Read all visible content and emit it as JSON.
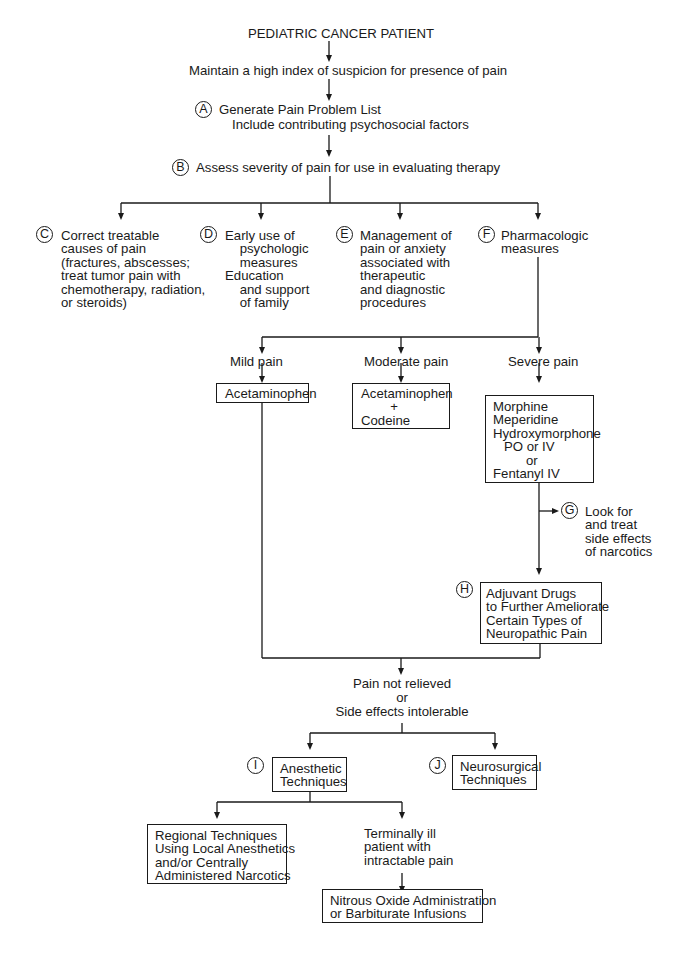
{
  "title": "PEDIATRIC CANCER PATIENT",
  "steps": {
    "suspicion": "Maintain a high index of suspicion for presence of pain",
    "A": {
      "badge": "A",
      "line1": "Generate Pain Problem List",
      "line2": "Include contributing psychosocial factors"
    },
    "B": {
      "badge": "B",
      "text": "Assess severity of pain for use in evaluating therapy"
    }
  },
  "branches": {
    "C": {
      "badge": "C",
      "text": "Correct treatable\ncauses of pain\n(fractures, abscesses;\ntreat tumor pain with\nchemotherapy, radiation,\nor steroids)"
    },
    "D": {
      "badge": "D",
      "text": "Early use of\n    psychologic\n    measures\nEducation\n    and support\n    of family"
    },
    "E": {
      "badge": "E",
      "text": "Management of\npain or anxiety\nassociated with\ntherapeutic\nand diagnostic\nprocedures"
    },
    "F": {
      "badge": "F",
      "text": "Pharmacologic\nmeasures"
    }
  },
  "pain_levels": {
    "mild": {
      "label": "Mild pain",
      "drug": "Acetaminophen"
    },
    "moderate": {
      "label": "Moderate pain",
      "drug": "Acetaminophen\n        +\nCodeine"
    },
    "severe": {
      "label": "Severe pain",
      "drug": "Morphine\nMeperidine\nHydroxymorphone\n   PO or IV\n         or\nFentanyl IV"
    }
  },
  "G": {
    "badge": "G",
    "text": "Look for\nand treat\nside effects\nof narcotics"
  },
  "H": {
    "badge": "H",
    "text": "Adjuvant Drugs\nto Further Ameliorate\nCertain Types of\nNeuropathic Pain"
  },
  "not_relieved": {
    "line1": "Pain not relieved",
    "line2": "or",
    "line3": "Side effects intolerable"
  },
  "I": {
    "badge": "I",
    "text": "Anesthetic\nTechniques"
  },
  "J": {
    "badge": "J",
    "text": "Neurosurgical\nTechniques"
  },
  "regional": {
    "text": "Regional Techniques\nUsing Local Anesthetics\nand/or Centrally\nAdministered Narcotics"
  },
  "terminal": {
    "text": "Terminally ill\npatient with\nintractable pain"
  },
  "nitrous": {
    "text": "Nitrous Oxide Administration\nor Barbiturate Infusions"
  }
}
